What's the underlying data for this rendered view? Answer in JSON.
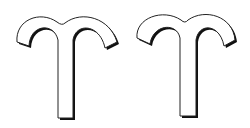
{
  "symbols": [
    {
      "name": "Aries",
      "glyph": "aries-icon",
      "fill": "#ffffff",
      "stroke": "#222222",
      "shadow": "#111111"
    },
    {
      "name": "Aries",
      "glyph": "aries-icon",
      "fill": "#ffffff",
      "stroke": "#222222",
      "shadow": "#111111"
    }
  ]
}
